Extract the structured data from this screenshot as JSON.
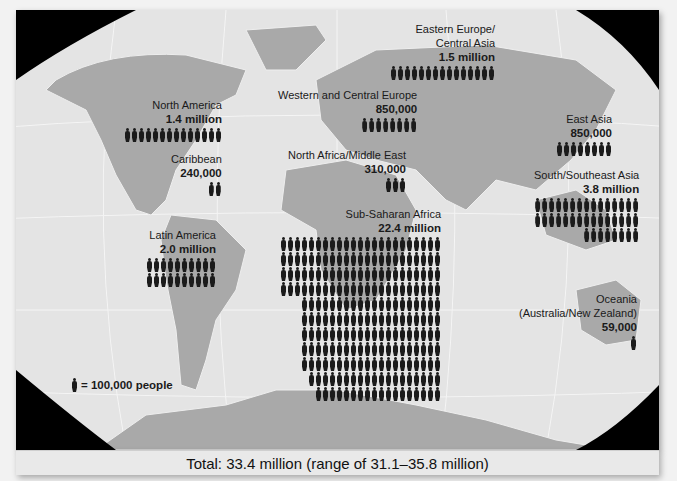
{
  "chart_data": {
    "type": "pictogram-map",
    "title": "",
    "unit_icon": "person-icon",
    "unit_value": 100000,
    "legend": "= 100,000 people",
    "categories": [
      "North America",
      "Caribbean",
      "Latin America",
      "Western and Central Europe",
      "Eastern Europe/Central Asia",
      "North Africa/Middle East",
      "Sub-Saharan Africa",
      "East Asia",
      "South/Southeast Asia",
      "Oceania (Australia/New Zealand)"
    ],
    "values": [
      1400000,
      240000,
      2000000,
      850000,
      1500000,
      310000,
      22400000,
      850000,
      3800000,
      59000
    ],
    "labels": [
      "1.4 million",
      "240,000",
      "2.0 million",
      "850,000",
      "1.5 million",
      "310,000",
      "22.4 million",
      "850,000",
      "3.8 million",
      "59,000"
    ],
    "total": "Total: 33.4 million (range of 31.1–35.8 million)",
    "total_value": 33400000,
    "total_range": [
      31100000,
      35800000
    ]
  },
  "regions": {
    "north_america": {
      "name": "North America",
      "value": "1.4 million"
    },
    "caribbean": {
      "name": "Caribbean",
      "value": "240,000"
    },
    "latin_america": {
      "name": "Latin America",
      "value": "2.0 million"
    },
    "western_europe": {
      "name": "Western and Central Europe",
      "value": "850,000"
    },
    "eastern_europe_l1": "Eastern Europe/",
    "eastern_europe_l2": "Central Asia",
    "eastern_europe": {
      "value": "1.5 million"
    },
    "north_africa": {
      "name": "North Africa/Middle East",
      "value": "310,000"
    },
    "subsaharan": {
      "name": "Sub-Saharan Africa",
      "value": "22.4 million"
    },
    "east_asia": {
      "name": "East Asia",
      "value": "850,000"
    },
    "south_asia": {
      "name": "South/Southeast Asia",
      "value": "3.8 million"
    },
    "oceania_l1": "Oceania",
    "oceania_l2": "(Australia/New Zealand)",
    "oceania": {
      "value": "59,000"
    }
  },
  "legend": {
    "label": "= 100,000 people"
  },
  "footer": {
    "total": "Total: 33.4 million (range of 31.1–35.8 million)"
  },
  "colors": {
    "ocean": "#e6e6e6",
    "land": "#a9a9a9",
    "icon": "#1b1b1b",
    "corners": "#000000"
  }
}
